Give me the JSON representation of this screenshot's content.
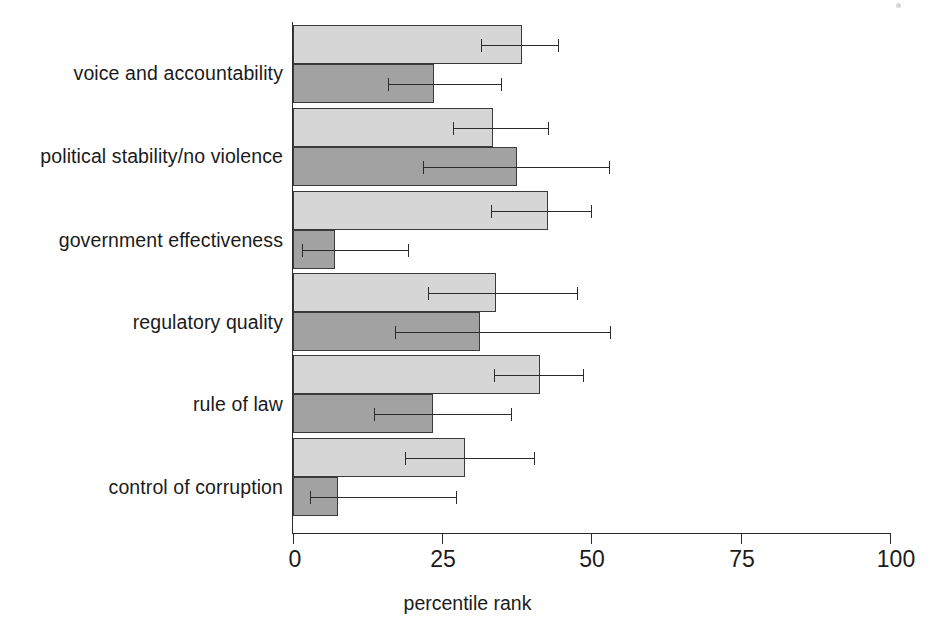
{
  "chart_data": {
    "type": "bar",
    "orientation": "horizontal",
    "title": "",
    "xlabel": "percentile rank",
    "ylabel": "",
    "xlim": [
      0,
      100
    ],
    "ylim": null,
    "grid": false,
    "legend": null,
    "xticks": [
      "0",
      "25",
      "50",
      "75",
      "100"
    ],
    "xtick_values": [
      0,
      25,
      50,
      75,
      100
    ],
    "categories": [
      "voice and accountability",
      "political stability/no violence",
      "government effectiveness",
      "regulatory quality",
      "rule of law",
      "control of corruption"
    ],
    "series": [
      {
        "name": "upper bar",
        "style": "light-gray",
        "color": "#d6d6d6",
        "values": [
          38.4,
          33.6,
          42.8,
          34.1,
          41.4,
          28.9
        ],
        "error_low": [
          31.5,
          26.8,
          33.2,
          22.6,
          33.8,
          18.8
        ],
        "error_high": [
          44.6,
          42.9,
          50.2,
          47.9,
          48.8,
          40.6
        ]
      },
      {
        "name": "lower bar",
        "style": "medium-gray",
        "color": "#a2a2a2",
        "values": [
          23.7,
          37.6,
          7.0,
          31.4,
          23.5,
          7.6
        ],
        "error_low": [
          15.9,
          21.8,
          1.5,
          17.1,
          13.6,
          2.9
        ],
        "error_high": [
          35.0,
          53.2,
          19.5,
          53.4,
          36.8,
          27.6
        ]
      }
    ]
  },
  "axis": {
    "x_label_text": "percentile rank"
  }
}
